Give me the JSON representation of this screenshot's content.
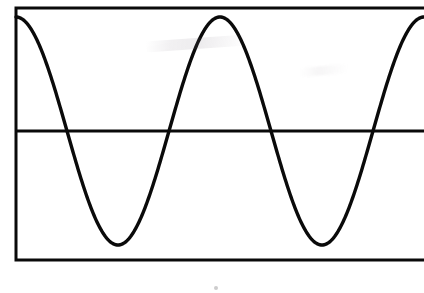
{
  "figure": {
    "background_color": "#ffffff",
    "width": 424,
    "height": 293,
    "caption": ""
  },
  "frame": {
    "name": "rectangular-plot-frame",
    "stroke_color": "#0a0a0a",
    "stroke_width": 3,
    "left": 16,
    "top": 8,
    "bottom": 260,
    "right_clipped_at": 424,
    "right_edge_visible": false
  },
  "axis": {
    "name": "horizontal-midline",
    "stroke_color": "#0a0a0a",
    "stroke_width": 3,
    "y": 131,
    "x_start": 16,
    "x_end": 424,
    "label": ""
  },
  "artifacts": [
    {
      "name": "smudge-upper-left",
      "x": 146,
      "y": 38,
      "width": 100,
      "height": 11
    },
    {
      "name": "smudge-upper-right",
      "x": 300,
      "y": 66,
      "width": 48,
      "height": 9
    },
    {
      "name": "speck-below-frame",
      "x": 214,
      "y": 286,
      "width": 4,
      "height": 4
    }
  ],
  "chart_data": {
    "type": "line",
    "title": "",
    "subtitle": "",
    "xlabel": "",
    "ylabel": "",
    "grid": false,
    "legend": null,
    "curve_name": "sine-wave",
    "stroke_color": "#0a0a0a",
    "stroke_width": 3.4,
    "function": "y = A * cos(2*pi*(x - x0)/T)",
    "amplitude_px": 114,
    "period_px": 204,
    "baseline_y_px": 131,
    "phase": "cosine (starts at maximum at left frame edge)",
    "cycles_visible": 2.0,
    "x_domain_px": [
      16,
      424
    ],
    "y_domain_px": [
      17,
      245
    ],
    "keypoints": [
      {
        "label": "peak-0",
        "x": 16,
        "y": 17,
        "kind": "maximum"
      },
      {
        "label": "zero-crossing-1",
        "x": 67,
        "y": 131,
        "kind": "descending-zero"
      },
      {
        "label": "trough-1",
        "x": 118,
        "y": 245,
        "kind": "minimum"
      },
      {
        "label": "zero-crossing-2",
        "x": 170,
        "y": 131,
        "kind": "ascending-zero"
      },
      {
        "label": "peak-1",
        "x": 222,
        "y": 17,
        "kind": "maximum"
      },
      {
        "label": "zero-crossing-3",
        "x": 272,
        "y": 131,
        "kind": "descending-zero"
      },
      {
        "label": "trough-2",
        "x": 322,
        "y": 245,
        "kind": "minimum"
      },
      {
        "label": "zero-crossing-4",
        "x": 374,
        "y": 131,
        "kind": "ascending-zero"
      },
      {
        "label": "peak-2",
        "x": 424,
        "y": 17,
        "kind": "maximum-clipped"
      }
    ],
    "x": [
      16,
      26,
      36,
      46,
      56,
      67,
      77,
      87,
      97,
      108,
      118,
      128,
      139,
      149,
      160,
      170,
      181,
      191,
      201,
      212,
      222,
      232,
      242,
      252,
      262,
      272,
      282,
      292,
      302,
      312,
      322,
      333,
      343,
      354,
      364,
      374,
      385,
      395,
      405,
      415,
      424
    ],
    "y": [
      17,
      20,
      31,
      47,
      70,
      131,
      160,
      189,
      214,
      236,
      245,
      244,
      234,
      214,
      160,
      131,
      89,
      56,
      33,
      20,
      17,
      22,
      35,
      56,
      89,
      131,
      160,
      189,
      214,
      236,
      245,
      244,
      234,
      207,
      160,
      131,
      89,
      56,
      33,
      20,
      17
    ]
  }
}
